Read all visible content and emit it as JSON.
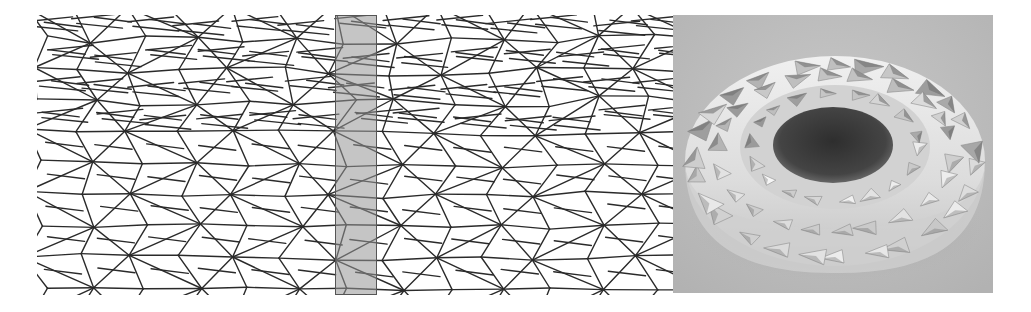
{
  "figure": {
    "panels": [
      {
        "id": "crease-pattern",
        "kind": "crease-pattern-line-drawing",
        "x": 37,
        "y": 15,
        "width": 636,
        "height": 280,
        "line_color": "#2a2a2a",
        "background": "#ffffff",
        "columns": 12,
        "rows": 9,
        "highlight_band": {
          "x_offset": 298,
          "width": 42,
          "fill": "#9a9a9a",
          "border": "#555555"
        }
      },
      {
        "id": "folded-torus-render",
        "kind": "rendered-photo",
        "x": 673,
        "y": 15,
        "width": 320,
        "height": 278,
        "background": "#bdbdbd",
        "object_color": "#e6e6e6",
        "shadow_color": "#8a8a8a",
        "hole_color": "#3a3a3a"
      }
    ]
  }
}
